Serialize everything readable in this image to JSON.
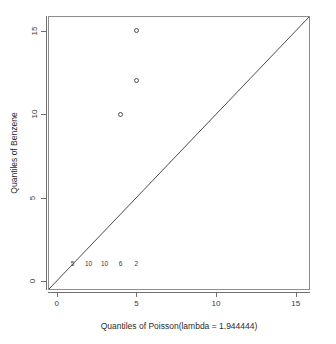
{
  "chart_data": {
    "type": "scatter",
    "title": "",
    "xlabel": "Quantiles of Poisson(lambda = 1.944444)",
    "ylabel": "Quantiles of Benzene",
    "xlim": [
      -0.55,
      15.9
    ],
    "ylim": [
      -0.55,
      15.9
    ],
    "grid": false,
    "legend": null,
    "x_ticks": [
      {
        "value": 0,
        "label": "0"
      },
      {
        "value": 5,
        "label": "5"
      },
      {
        "value": 10,
        "label": "10"
      },
      {
        "value": 15,
        "label": "15"
      }
    ],
    "y_ticks": [
      {
        "value": 0,
        "label": "0"
      },
      {
        "value": 5,
        "label": "5"
      },
      {
        "value": 10,
        "label": "10"
      },
      {
        "value": 15,
        "label": "15"
      }
    ],
    "series": [
      {
        "name": "quantile-points",
        "marker": "open-circle",
        "points": [
          {
            "x": 4,
            "y": 10
          },
          {
            "x": 5,
            "y": 12
          },
          {
            "x": 5,
            "y": 15
          }
        ]
      }
    ],
    "reference_line": {
      "name": "identity-line",
      "type": "line",
      "from": {
        "x": -0.55,
        "y": -0.55
      },
      "to": {
        "x": 15.9,
        "y": 15.9
      }
    },
    "annotations": [
      {
        "text": "5",
        "x": 1,
        "y": 1
      },
      {
        "text": "10",
        "x": 2,
        "y": 1
      },
      {
        "text": "10",
        "x": 3,
        "y": 1
      },
      {
        "text": "6",
        "x": 4,
        "y": 1
      },
      {
        "text": "2",
        "x": 5,
        "y": 1
      }
    ],
    "colors": {
      "axis": "#6f6f6f",
      "panel_border": "#8d8d8d",
      "point": "#4f4f4f",
      "line": "#4a4a4a",
      "text": "#2a2a2a",
      "background": "#ffffff"
    }
  }
}
